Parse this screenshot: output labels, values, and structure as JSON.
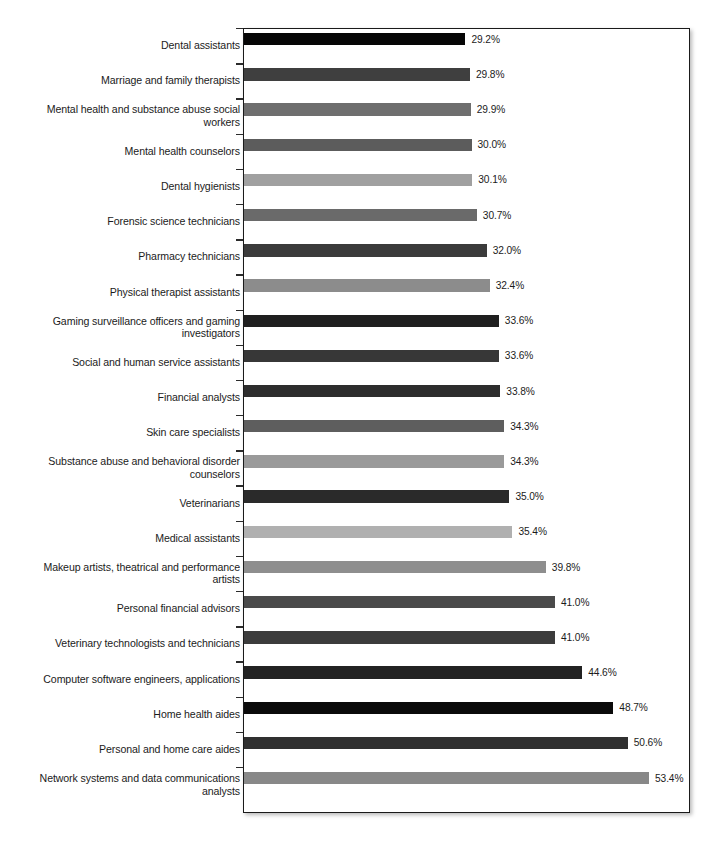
{
  "chart_data": {
    "type": "bar",
    "orientation": "horizontal",
    "title": "",
    "subtitle": "",
    "xlabel": "",
    "ylabel": "",
    "xlim": [
      0,
      53.4
    ],
    "grid": false,
    "legend": null,
    "value_suffix": "%",
    "categories": [
      "Dental assistants",
      "Marriage and family therapists",
      "Mental health and substance abuse social\nworkers",
      "Mental health counselors",
      "Dental hygienists",
      "Forensic science technicians",
      "Pharmacy technicians",
      "Physical therapist assistants",
      "Gaming surveillance officers and gaming\ninvestigators",
      "Social and human service assistants",
      "Financial analysts",
      "Skin care specialists",
      "Substance abuse and behavioral disorder\ncounselors",
      "Veterinarians",
      "Medical assistants",
      "Makeup artists, theatrical and performance\nartists",
      "Personal financial advisors",
      "Veterinary technologists and technicians",
      "Computer software engineers, applications",
      "Home health aides",
      "Personal and home care aides",
      "Network systems and data communications\nanalysts"
    ],
    "values": [
      29.2,
      29.8,
      29.9,
      30.0,
      30.1,
      30.7,
      32.0,
      32.4,
      33.6,
      33.6,
      33.8,
      34.3,
      34.3,
      35.0,
      35.4,
      39.8,
      41.0,
      41.0,
      44.6,
      48.7,
      50.6,
      53.4
    ],
    "value_labels": [
      "29.2%",
      "29.8%",
      "29.9%",
      "30.0%",
      "30.1%",
      "30.7%",
      "32.0%",
      "32.4%",
      "33.6%",
      "33.6%",
      "33.8%",
      "34.3%",
      "34.3%",
      "35.0%",
      "35.4%",
      "39.8%",
      "41.0%",
      "41.0%",
      "44.6%",
      "48.7%",
      "50.6%",
      "53.4%"
    ],
    "bar_colors": [
      "#060606",
      "#3f3f3f",
      "#6e6e6e",
      "#5c5c5c",
      "#a0a0a0",
      "#6a6a6a",
      "#3b3b3b",
      "#8c8c8c",
      "#1f1f1f",
      "#373737",
      "#2d2d2d",
      "#5e5e5e",
      "#9a9a9a",
      "#2a2a2a",
      "#b0b0b0",
      "#8e8e8e",
      "#4a4a4a",
      "#3c3c3c",
      "#222222",
      "#0a0a0a",
      "#303030",
      "#888888"
    ]
  }
}
